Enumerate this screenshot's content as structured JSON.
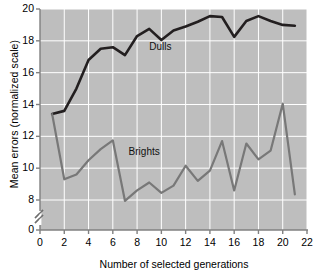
{
  "chart_data": {
    "type": "line",
    "title": "",
    "xlabel": "Number of selected generations",
    "ylabel": "Mean errors (normalized scale)",
    "xlim": [
      0,
      22
    ],
    "ylim": [
      7.6,
      20
    ],
    "y_axis_break": true,
    "y_break_note": "axis broken between 0 and 8",
    "grid": true,
    "legend_position": "inline-annotations",
    "xticks": [
      0,
      2,
      4,
      6,
      8,
      10,
      12,
      14,
      16,
      18,
      20,
      22
    ],
    "xtick_labels": [
      "0",
      "2",
      "4",
      "6",
      "8",
      "10",
      "12",
      "14",
      "16",
      "18",
      "20",
      "22"
    ],
    "yticks": [
      0,
      8,
      10,
      12,
      14,
      16,
      18,
      20
    ],
    "ytick_labels": [
      "0",
      "8",
      "10",
      "12",
      "14",
      "16",
      "18",
      "20"
    ],
    "x": [
      1,
      2,
      3,
      4,
      5,
      6,
      7,
      8,
      9,
      10,
      11,
      12,
      13,
      14,
      15,
      16,
      17,
      18,
      19,
      20,
      21
    ],
    "series": [
      {
        "name": "Dulls",
        "color": "#231f20",
        "values": [
          13.4,
          13.6,
          15.0,
          16.8,
          17.5,
          17.6,
          17.1,
          18.3,
          18.75,
          18.05,
          18.65,
          18.9,
          19.2,
          19.55,
          19.5,
          18.25,
          19.25,
          19.55,
          19.25,
          19.0,
          18.95
        ]
      },
      {
        "name": "Brights",
        "color": "#787878",
        "values": [
          13.4,
          9.3,
          9.6,
          10.5,
          11.2,
          11.75,
          7.95,
          8.6,
          9.1,
          8.45,
          8.9,
          10.15,
          9.2,
          9.85,
          11.7,
          8.6,
          11.55,
          10.55,
          11.1,
          14.05,
          8.35
        ]
      }
    ],
    "annotations": [
      {
        "text": "Dulls",
        "x": 9.0,
        "y": 17.6
      },
      {
        "text": "Brights",
        "x": 7.3,
        "y": 11.0
      }
    ],
    "plot_background": "#bebebe",
    "grid_color": "#ffffff",
    "axis_color": "#808080"
  }
}
